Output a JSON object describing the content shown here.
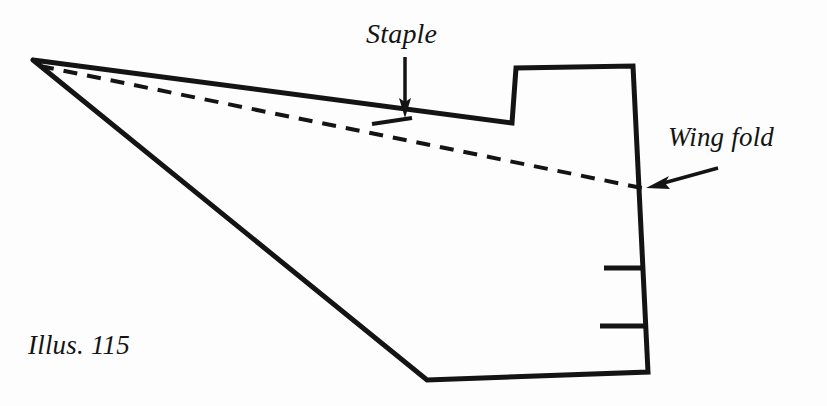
{
  "figure": {
    "caption": "Illus. 115",
    "background_color": "#fdfdfd",
    "ink_color": "#141414",
    "width": 827,
    "height": 406
  },
  "annotations": {
    "staple": {
      "label": "Staple",
      "arrow_direction": "down",
      "arrow_from": [
        405,
        57
      ],
      "arrow_to": [
        405,
        115
      ],
      "points_at": "staple-mark"
    },
    "wing_fold": {
      "label": "Wing fold",
      "arrow_direction": "left-down",
      "arrow_from": [
        718,
        168
      ],
      "arrow_to": [
        646,
        188
      ],
      "points_at": "fold-line"
    }
  },
  "shapes": {
    "wing_outline": {
      "name": "wing-outline",
      "stroke_width": 5,
      "points": [
        [
          33,
          60
        ],
        [
          512,
          123
        ],
        [
          516,
          68
        ],
        [
          633,
          66
        ],
        [
          648,
          372
        ],
        [
          427,
          380
        ]
      ]
    },
    "fold_line": {
      "name": "fold-line",
      "style": "dashed",
      "stroke_width": 4,
      "dash": "14 10",
      "from": [
        40,
        66
      ],
      "to": [
        642,
        188
      ]
    },
    "staple_mark": {
      "name": "staple-mark",
      "stroke_width": 4,
      "from": [
        372,
        124
      ],
      "to": [
        412,
        118
      ]
    },
    "tick_marks": [
      {
        "name": "tick-mark-upper",
        "from": [
          604,
          268
        ],
        "to": [
          645,
          268
        ],
        "stroke_width": 5
      },
      {
        "name": "tick-mark-lower",
        "from": [
          600,
          326
        ],
        "to": [
          646,
          326
        ],
        "stroke_width": 5
      }
    ]
  }
}
